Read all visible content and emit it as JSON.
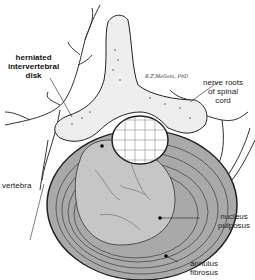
{
  "figure": {
    "signature": "B.Z.Melloni, PhD",
    "labels": {
      "herniated_disk": [
        "herniated",
        "intervertebral",
        "disk"
      ],
      "nerve_roots": [
        "nerve roots",
        "of spinal",
        "cord"
      ],
      "vertebra": "vertebra",
      "nucleus_pulposus": [
        "nucleus",
        "pulposus"
      ],
      "annulus_fibrosus": [
        "annulus",
        "fibrosus"
      ]
    },
    "colors": {
      "background": "#ffffff",
      "ink": "#1a1a1a",
      "disk_fill": "#b5b5b5",
      "nucleus_fill": "#c8c8c8",
      "bone_fill": "#eeeeee"
    }
  }
}
